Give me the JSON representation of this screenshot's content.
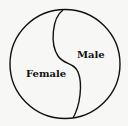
{
  "diagram": {
    "type": "divided-circle",
    "regions": [
      {
        "label": "Female",
        "side": "left"
      },
      {
        "label": "Male",
        "side": "right"
      }
    ],
    "colors": {
      "stroke": "#111111",
      "background": "#f7f7f5"
    }
  }
}
